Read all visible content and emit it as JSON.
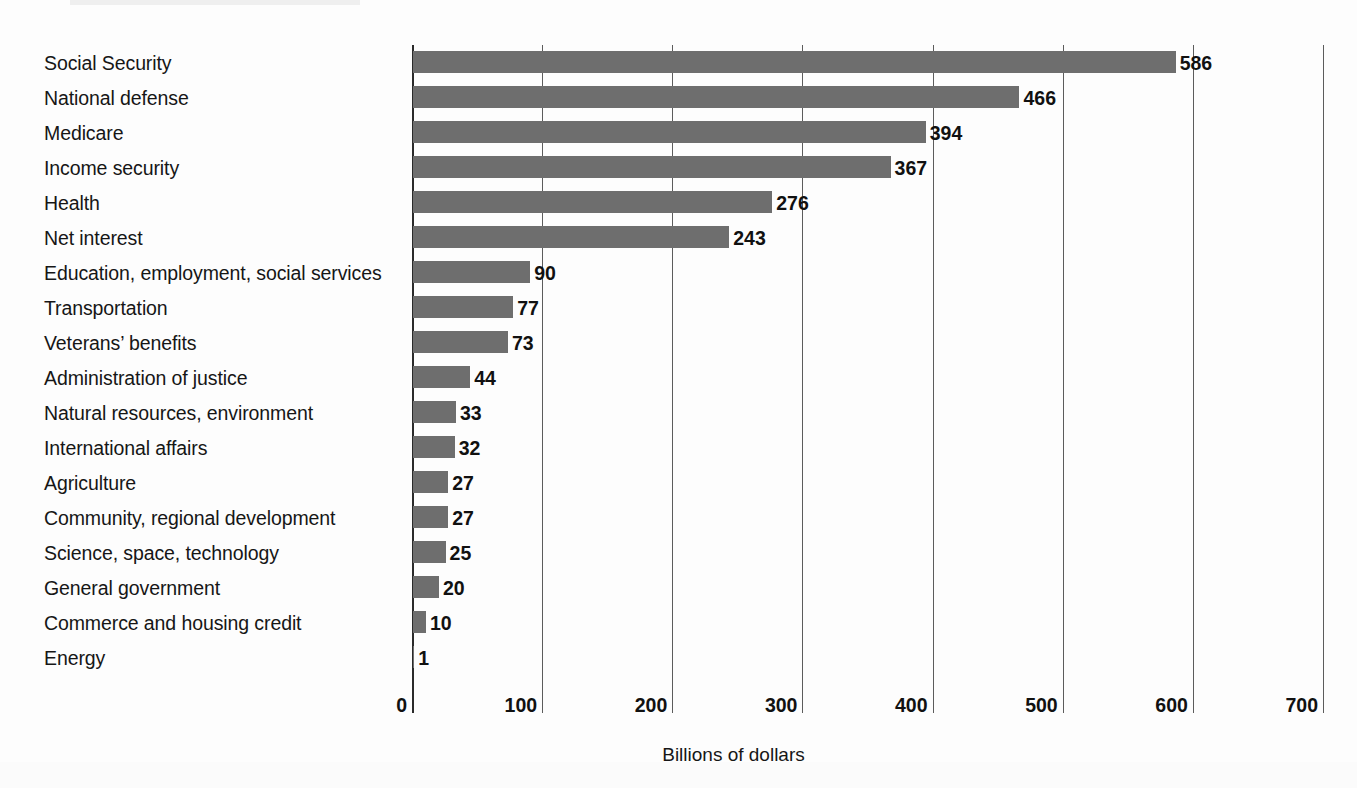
{
  "chart_data": {
    "type": "bar",
    "orientation": "horizontal",
    "title": "",
    "subtitle": "",
    "xlabel": "Billions of dollars",
    "ylabel": "",
    "xlim": [
      0,
      700
    ],
    "xticks": [
      0,
      100,
      200,
      300,
      400,
      500,
      600,
      700
    ],
    "xtick_labels": [
      "0",
      "100",
      "200",
      "300",
      "400",
      "500",
      "600",
      "700"
    ],
    "grid": "vertical",
    "legend": "none",
    "bar_color": "#6e6e6e",
    "value_labels": true,
    "categories": [
      "Social Security",
      "National defense",
      "Medicare",
      "Income security",
      "Health",
      "Net interest",
      "Education, employment, social services",
      "Transportation",
      "Veterans’ benefits",
      "Administration of justice",
      "Natural resources, environment",
      "International affairs",
      "Agriculture",
      "Community, regional development",
      "Science, space, technology",
      "General government",
      "Commerce and housing credit",
      "Energy"
    ],
    "values": [
      586,
      466,
      394,
      367,
      276,
      243,
      90,
      77,
      73,
      44,
      33,
      32,
      27,
      27,
      25,
      20,
      10,
      1
    ],
    "value_label_texts": [
      "586",
      "466",
      "394",
      "367",
      "276",
      "243",
      "90",
      "77",
      "73",
      "44",
      "33",
      "32",
      "27",
      "27",
      "25",
      "20",
      "10",
      "1"
    ]
  }
}
